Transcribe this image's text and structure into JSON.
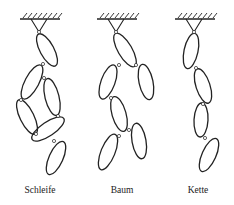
{
  "figure": {
    "stroke_color": "#222222",
    "background": "#ffffff",
    "panels": [
      {
        "id": "schleife",
        "label": "Schleife",
        "label_x": 40,
        "ground": {
          "x1": 20,
          "x2": 60,
          "y": 19
        },
        "pivot": {
          "x": 39,
          "y": 32
        },
        "bodies": [
          {
            "cx": 47,
            "cy": 50,
            "rx": 7,
            "ry": 18,
            "rot": -28
          },
          {
            "cx": 32,
            "cy": 82,
            "rx": 7,
            "ry": 19,
            "rot": 28
          },
          {
            "cx": 52,
            "cy": 97,
            "rx": 7,
            "ry": 19,
            "rot": -14
          },
          {
            "cx": 27,
            "cy": 117,
            "rx": 7,
            "ry": 19,
            "rot": -26
          },
          {
            "cx": 48,
            "cy": 129,
            "rx": 7,
            "ry": 19,
            "rot": 56
          },
          {
            "cx": 56,
            "cy": 158,
            "rx": 7,
            "ry": 18,
            "rot": 24
          }
        ],
        "joints": [
          [
            39,
            32
          ],
          [
            43,
            64
          ],
          [
            44,
            78
          ],
          [
            21,
            100
          ],
          [
            58,
            116
          ],
          [
            36,
            134
          ],
          [
            54,
            141
          ]
        ]
      },
      {
        "id": "baum",
        "label": "Baum",
        "label_x": 122,
        "ground": {
          "x1": 97,
          "x2": 137,
          "y": 19
        },
        "pivot": {
          "x": 116,
          "y": 32
        },
        "bodies": [
          {
            "cx": 125,
            "cy": 50,
            "rx": 7,
            "ry": 19,
            "rot": -30
          },
          {
            "cx": 108,
            "cy": 82,
            "rx": 7,
            "ry": 18,
            "rot": 20
          },
          {
            "cx": 146,
            "cy": 82,
            "rx": 7,
            "ry": 18,
            "rot": -12
          },
          {
            "cx": 119,
            "cy": 114,
            "rx": 7,
            "ry": 18,
            "rot": -16
          },
          {
            "cx": 108,
            "cy": 152,
            "rx": 7,
            "ry": 19,
            "rot": 22
          },
          {
            "cx": 139,
            "cy": 141,
            "rx": 7,
            "ry": 18,
            "rot": -10
          }
        ],
        "joints": [
          [
            116,
            32
          ],
          [
            119,
            65
          ],
          [
            136,
            65
          ],
          [
            111,
            98
          ],
          [
            119,
            136
          ],
          [
            129,
            130
          ]
        ]
      },
      {
        "id": "kette",
        "label": "Kette",
        "label_x": 198,
        "ground": {
          "x1": 175,
          "x2": 215,
          "y": 19
        },
        "pivot": {
          "x": 194,
          "y": 32
        },
        "bodies": [
          {
            "cx": 191,
            "cy": 51,
            "rx": 7,
            "ry": 18,
            "rot": 12
          },
          {
            "cx": 203,
            "cy": 86,
            "rx": 7,
            "ry": 18,
            "rot": -18
          },
          {
            "cx": 201,
            "cy": 120,
            "rx": 7,
            "ry": 17,
            "rot": 3
          },
          {
            "cx": 209,
            "cy": 155,
            "rx": 7,
            "ry": 18,
            "rot": 24
          }
        ],
        "joints": [
          [
            194,
            32
          ],
          [
            196,
            68
          ],
          [
            203,
            104
          ],
          [
            205,
            138
          ]
        ]
      }
    ]
  },
  "labels": {
    "schleife": "Schleife",
    "baum": "Baum",
    "kette": "Kette"
  }
}
